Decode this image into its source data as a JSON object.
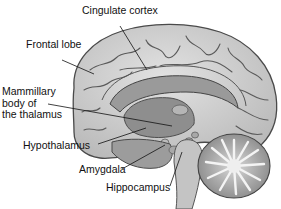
{
  "diagram": {
    "labels": {
      "cingulate_cortex": "Cingulate cortex",
      "frontal_lobe": "Frontal lobe",
      "mammillary_body": "Mammillary\nbody of\nthe thalamus",
      "hypothalamus": "Hypothalamus",
      "amygdala": "Amygdala",
      "hippocampus": "Hippocampus"
    },
    "colors": {
      "cortex": "#cfcfcf",
      "sulci": "#5a5a5a",
      "deep": "#8e8e8e",
      "label_text": "#111111"
    }
  }
}
